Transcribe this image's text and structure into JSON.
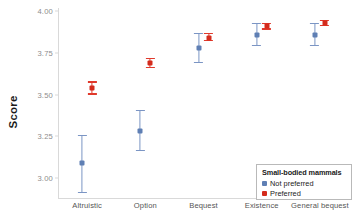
{
  "chart_data": {
    "type": "scatter",
    "title": "",
    "xlabel": "",
    "ylabel": "Score",
    "ylim": [
      2.88,
      4.02
    ],
    "yticks": [
      3.0,
      3.25,
      3.5,
      3.75,
      4.0
    ],
    "ytick_labels": [
      "3.00",
      "3.25",
      "3.50",
      "3.75",
      "4.00"
    ],
    "categories": [
      "Altruistic",
      "Option",
      "Bequest",
      "Existence",
      "General bequest"
    ],
    "grid": false,
    "legend_position": "bottom-right",
    "legend_title": "Small-bodied mammals",
    "series": [
      {
        "name": "Not preferred",
        "color": "#5f7fb4",
        "values": [
          3.09,
          3.28,
          3.78,
          3.86,
          3.86
        ],
        "ci_low": [
          2.91,
          3.16,
          3.69,
          3.79,
          3.79
        ],
        "ci_high": [
          3.26,
          3.41,
          3.87,
          3.93,
          3.93
        ]
      },
      {
        "name": "Preferred",
        "color": "#d42b1c",
        "values": [
          3.54,
          3.69,
          3.84,
          3.91,
          3.93
        ],
        "ci_low": [
          3.5,
          3.66,
          3.82,
          3.89,
          3.91
        ],
        "ci_high": [
          3.58,
          3.72,
          3.87,
          3.93,
          3.95
        ]
      }
    ]
  },
  "legend": {
    "title": "Small-bodied mammals",
    "items": [
      {
        "label": "Not preferred",
        "color": "#5f7fb4"
      },
      {
        "label": "Preferred",
        "color": "#d42b1c"
      }
    ]
  },
  "axes": {
    "y_title": "Score"
  }
}
